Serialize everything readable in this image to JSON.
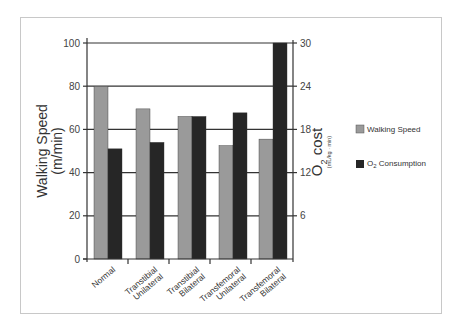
{
  "chart_data": {
    "type": "bar",
    "title": "",
    "categories": [
      "Normal",
      "Transtibial Unilateral",
      "Transtibial Bilateral",
      "Transfemoral Unilateral",
      "Transfemoral Bilateral"
    ],
    "category_lines": [
      [
        "Normal"
      ],
      [
        "Transtibial",
        "Unilateral"
      ],
      [
        "Transtibial",
        "Bilateral"
      ],
      [
        "Transfemoral",
        "Unilateral"
      ],
      [
        "Transfemoral",
        "Bilateral"
      ]
    ],
    "series": [
      {
        "name": "Walking Speed",
        "axis": "left",
        "color": "#9a9a9a",
        "values": [
          80,
          69.5,
          66,
          52.5,
          55.5
        ]
      },
      {
        "name": "O2 Consumption",
        "axis": "right",
        "color": "#262626",
        "values": [
          15.3,
          16.2,
          19.8,
          20.3,
          30
        ]
      }
    ],
    "left_axis": {
      "label_line1": "Walking Speed",
      "label_line2": "(m/min)",
      "ylim": [
        0,
        100
      ],
      "ticks": [
        0,
        20,
        40,
        60,
        80,
        100
      ]
    },
    "right_axis": {
      "label_main": "O",
      "label_sub": "2",
      "label_rest": " cost",
      "units": "(mL/kg · min)",
      "ylim": [
        0,
        30
      ],
      "ticks": [
        6,
        12,
        18,
        24,
        30
      ]
    },
    "grid": true,
    "legend": {
      "position": "right",
      "items": [
        {
          "label": "Walking Speed",
          "color": "#9a9a9a"
        },
        {
          "label_main": "O",
          "label_sub": "2",
          "label_rest": " Consumption",
          "color": "#262626"
        }
      ]
    }
  }
}
